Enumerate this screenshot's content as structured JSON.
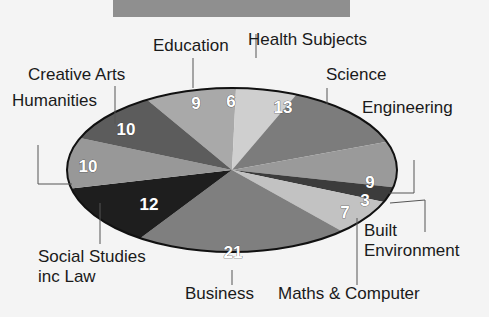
{
  "chart_data": {
    "type": "pie",
    "title": "",
    "categories": [
      "Education",
      "Health Subjects",
      "Science",
      "Engineering",
      "Built Environment",
      "Maths & Computer",
      "Business",
      "Social Studies inc Law",
      "Humanities",
      "Creative Arts"
    ],
    "values": [
      9,
      6,
      13,
      9,
      3,
      7,
      21,
      12,
      10,
      10
    ],
    "colors": [
      "#a9a9a9",
      "#cfcfcf",
      "#7c7c7c",
      "#9a9a9a",
      "#3c3c3c",
      "#c2c2c2",
      "#7f7f7f",
      "#1e1e1e",
      "#989898",
      "#5c5c5c"
    ],
    "labels": [
      {
        "name": "Education",
        "display": [
          "Education"
        ],
        "value": "9"
      },
      {
        "name": "Health Subjects",
        "display": [
          "Health Subjects"
        ],
        "value": "6"
      },
      {
        "name": "Science",
        "display": [
          "Science"
        ],
        "value": "13"
      },
      {
        "name": "Engineering",
        "display": [
          "Engineering"
        ],
        "value": "9"
      },
      {
        "name": "Built Environment",
        "display": [
          "Built",
          "Environment"
        ],
        "value": "3"
      },
      {
        "name": "Maths & Computer",
        "display": [
          "Maths & Computer"
        ],
        "value": "7"
      },
      {
        "name": "Business",
        "display": [
          "Business"
        ],
        "value": "21"
      },
      {
        "name": "Social Studies inc Law",
        "display": [
          "Social Studies",
          "inc Law"
        ],
        "value": "12"
      },
      {
        "name": "Humanities",
        "display": [
          "Humanities"
        ],
        "value": "10"
      },
      {
        "name": "Creative Arts",
        "display": [
          "Creative Arts"
        ],
        "value": "10"
      }
    ],
    "legend": "none (leader-line labels)"
  }
}
